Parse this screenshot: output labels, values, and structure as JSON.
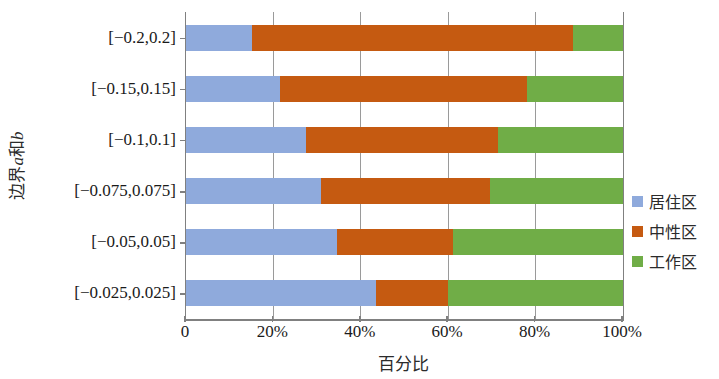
{
  "chart_data": {
    "type": "bar",
    "subtype": "horizontal-100-percent-stacked",
    "title": "",
    "xlabel": "百分比",
    "ylabel": "边界a和b",
    "ylabel_parts": {
      "prefix": "边界",
      "italic": "a",
      "mid": "和",
      "italic2": "b"
    },
    "categories": [
      "[−0.2,0.2]",
      "[−0.15,0.15]",
      "[−0.1,0.1]",
      "[−0.075,0.075]",
      "[−0.05,0.05]",
      "[−0.025,0.025]"
    ],
    "series": [
      {
        "name": "居住区",
        "color": "#8FAADC",
        "values": [
          15.0,
          21.5,
          27.5,
          31.0,
          34.5,
          43.5
        ]
      },
      {
        "name": "中性区",
        "color": "#C55A11",
        "values": [
          73.5,
          56.5,
          44.0,
          38.5,
          26.5,
          16.5
        ]
      },
      {
        "name": "工作区",
        "color": "#70AD47",
        "values": [
          11.5,
          22.0,
          28.5,
          30.5,
          39.0,
          40.0
        ]
      }
    ],
    "xlim": [
      0,
      100
    ],
    "xticks": [
      0,
      20,
      40,
      60,
      80,
      100
    ],
    "xtick_labels": [
      "0",
      "20%",
      "40%",
      "60%",
      "80%",
      "100%"
    ],
    "grid": true,
    "grid_axis": "x",
    "legend_position": "right"
  },
  "legend": {
    "items": [
      {
        "label": "居住区",
        "color": "#8FAADC"
      },
      {
        "label": "中性区",
        "color": "#C55A11"
      },
      {
        "label": "工作区",
        "color": "#70AD47"
      }
    ]
  },
  "colors": {
    "residential": "#8FAADC",
    "neutral": "#C55A11",
    "work": "#70AD47",
    "axis": "#808080",
    "grid": "#9A9A9A",
    "text": "#1A1A1A",
    "background": "#FFFFFF"
  }
}
